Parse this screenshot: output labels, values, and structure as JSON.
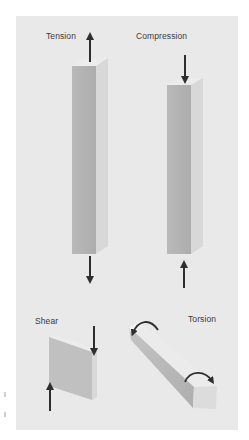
{
  "figure": {
    "background_color": "#e9e9e9",
    "bar_front_color": "#b5b5b5",
    "bar_side_color": "#d6d6d6",
    "bar_top_color": "#ececec",
    "arrow_color": "#2e2e2e",
    "labels": {
      "tension": "Tension",
      "compression": "Compression",
      "shear": "Shear",
      "torsion": "Torsion"
    },
    "panels": [
      {
        "id": "tension",
        "label": "Tension",
        "forces": [
          "up arrow at top",
          "down arrow at bottom"
        ]
      },
      {
        "id": "compression",
        "label": "Compression",
        "forces": [
          "down arrow at top",
          "up arrow at bottom"
        ]
      },
      {
        "id": "shear",
        "label": "Shear",
        "forces": [
          "down arrow at right edge",
          "up arrow at left edge"
        ]
      },
      {
        "id": "torsion",
        "label": "Torsion",
        "forces": [
          "counter-rotation curved arrow at top end",
          "rotation curved arrow at bottom end"
        ]
      }
    ]
  }
}
